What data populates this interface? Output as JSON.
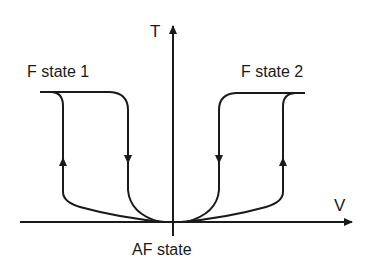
{
  "diagram": {
    "axes": {
      "y_label": "T",
      "x_label": "V"
    },
    "labels": {
      "left_state": "F state 1",
      "right_state": "F state 2",
      "origin_state": "AF state"
    },
    "colors": {
      "stroke": "#1a1a1a",
      "background": "#ffffff"
    }
  }
}
